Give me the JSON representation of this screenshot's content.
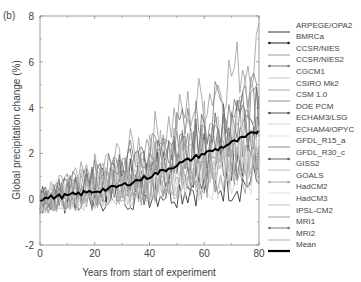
{
  "panel_label": "(b)",
  "chart_data": {
    "type": "line",
    "title": "",
    "xlabel": "Years from start of experiment",
    "ylabel": "Global precipitation change (%)",
    "xlim": [
      0,
      80
    ],
    "ylim": [
      -2,
      8
    ],
    "xticks": [
      0,
      20,
      40,
      60,
      80
    ],
    "yticks": [
      -2,
      0,
      2,
      4,
      6,
      8
    ],
    "xtick_labels": [
      "0",
      "20",
      "40",
      "60",
      "80"
    ],
    "ytick_labels": [
      "-2",
      "0",
      "2",
      "4",
      "6",
      "8"
    ],
    "grid": false,
    "legend_position": "right, outside plot",
    "series": [
      {
        "name": "ARPEGE/OPA2",
        "color": "#333333",
        "marker": false,
        "end_value": 2.6
      },
      {
        "name": "BMRCa",
        "color": "#222222",
        "marker": true,
        "end_value": 0.8
      },
      {
        "name": "CCSR/NIES",
        "color": "#9a9a9a",
        "marker": false,
        "end_value": 6.6
      },
      {
        "name": "CCSR/NIES2",
        "color": "#7a7a7a",
        "marker": true,
        "end_value": 5.2
      },
      {
        "name": "CGCM1",
        "color": "#c8c8c8",
        "marker": false,
        "end_value": 2.0
      },
      {
        "name": "CSIRO Mk2",
        "color": "#a8a8a8",
        "marker": false,
        "end_value": 4.4
      },
      {
        "name": "CSM 1.0",
        "color": "#909090",
        "marker": false,
        "end_value": 1.6
      },
      {
        "name": "DOE PCM",
        "color": "#555555",
        "marker": true,
        "end_value": 2.2
      },
      {
        "name": "ECHAM3/LSG",
        "color": "#d5d5d5",
        "marker": false,
        "end_value": 1.2
      },
      {
        "name": "ECHAM4/OPYC",
        "color": "#dddddd",
        "marker": false,
        "end_value": 2.4
      },
      {
        "name": "GFDL_R15_a",
        "color": "#888888",
        "marker": false,
        "end_value": 3.4
      },
      {
        "name": "GFDL_R30_c",
        "color": "#666666",
        "marker": true,
        "end_value": 3.9
      },
      {
        "name": "GISS2",
        "color": "#bbbbbb",
        "marker": false,
        "end_value": 1.8
      },
      {
        "name": "GOALS",
        "color": "#aaaaaa",
        "marker": true,
        "end_value": 2.8
      },
      {
        "name": "HadCM2",
        "color": "#e0e0e0",
        "marker": false,
        "end_value": 3.0
      },
      {
        "name": "HadCM3",
        "color": "#c0c0c0",
        "marker": false,
        "end_value": 2.2
      },
      {
        "name": "IPSL-CM2",
        "color": "#a0a0a0",
        "marker": false,
        "end_value": 1.4
      },
      {
        "name": "MRI1",
        "color": "#777777",
        "marker": true,
        "end_value": 3.6
      },
      {
        "name": "MRI2",
        "color": "#b0b0b0",
        "marker": false,
        "end_value": 2.5
      },
      {
        "name": "Mean",
        "color": "#000000",
        "marker": false,
        "bold": true,
        "x": [
          0,
          5,
          10,
          15,
          20,
          25,
          30,
          35,
          40,
          45,
          50,
          55,
          60,
          65,
          70,
          75,
          80
        ],
        "values": [
          0.0,
          0.1,
          0.15,
          0.25,
          0.35,
          0.45,
          0.6,
          0.8,
          1.0,
          1.25,
          1.5,
          1.75,
          2.0,
          2.2,
          2.45,
          2.7,
          3.0
        ]
      }
    ],
    "annotations": [
      {
        "text": "(b)",
        "position": "top-left panel label"
      }
    ]
  }
}
